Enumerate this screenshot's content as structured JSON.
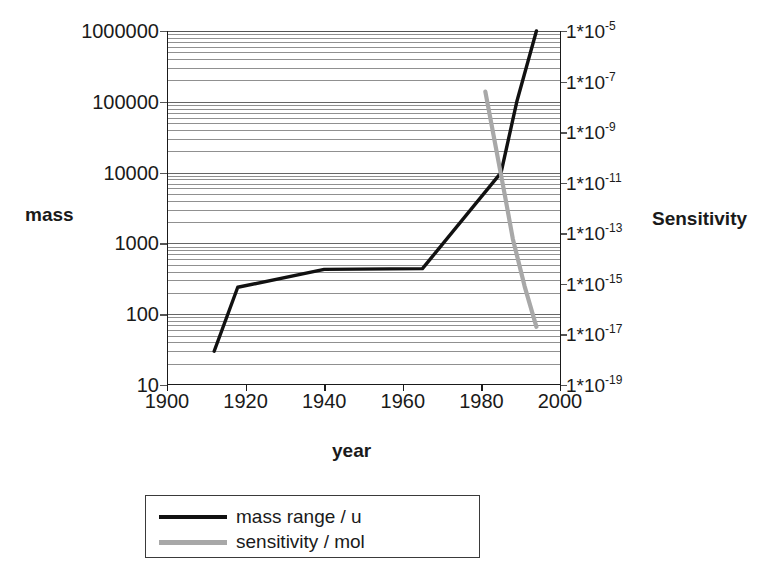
{
  "chart_data": {
    "type": "line",
    "title": "",
    "xlabel": "year",
    "ylabel_left": "mass",
    "ylabel_right": "Sensitivity",
    "xlim": [
      1900,
      2000
    ],
    "xticks": [
      1900,
      1920,
      1940,
      1960,
      1980,
      2000
    ],
    "xtick_labels": [
      "1900",
      "1920",
      "1940",
      "1960",
      "1980",
      "2000"
    ],
    "left_axis": {
      "scale": "log",
      "ylim": [
        10,
        1000000
      ],
      "yticks": [
        10,
        100,
        1000,
        10000,
        100000,
        1000000
      ],
      "ytick_labels": [
        "10",
        "100",
        "1000",
        "10000",
        "100000",
        "1000000"
      ],
      "unit": "u"
    },
    "right_axis": {
      "scale": "log",
      "ylim": [
        1e-19,
        1e-05
      ],
      "yticks": [
        1e-19,
        1e-17,
        1e-15,
        1e-13,
        1e-11,
        1e-09,
        1e-07,
        1e-05
      ],
      "ytick_labels": [
        {
          "mantissa": "1*10",
          "exponent": "-19"
        },
        {
          "mantissa": "1*10",
          "exponent": "-17"
        },
        {
          "mantissa": "1*10",
          "exponent": "-15"
        },
        {
          "mantissa": "1*10",
          "exponent": "-13"
        },
        {
          "mantissa": "1*10",
          "exponent": "-11"
        },
        {
          "mantissa": "1*10",
          "exponent": "-9"
        },
        {
          "mantissa": "1*10",
          "exponent": "-7"
        },
        {
          "mantissa": "1*10",
          "exponent": "-5"
        }
      ],
      "unit": "mol"
    },
    "grid": true,
    "grid_style": "log-minor-horizontal",
    "legend_position": "below-plot",
    "series": [
      {
        "name": "mass range / u",
        "axis": "left",
        "color": "#111111",
        "x": [
          1912,
          1918,
          1940,
          1965,
          1985,
          1989,
          1994
        ],
        "y": [
          30,
          240,
          430,
          440,
          10000,
          100000,
          1000000
        ]
      },
      {
        "name": "sensitivity / mol",
        "axis": "right",
        "color": "#a8a8a8",
        "x": [
          1981,
          1986,
          1988,
          1991,
          1994
        ],
        "y": [
          4e-08,
          3e-12,
          6e-14,
          8e-16,
          2e-17
        ]
      }
    ]
  },
  "legend": {
    "items": [
      {
        "label": "mass range / u",
        "color": "#111111"
      },
      {
        "label": "sensitivity / mol",
        "color": "#a8a8a8"
      }
    ]
  },
  "axis_titles": {
    "left": "mass",
    "right": "Sensitivity",
    "bottom": "year"
  }
}
